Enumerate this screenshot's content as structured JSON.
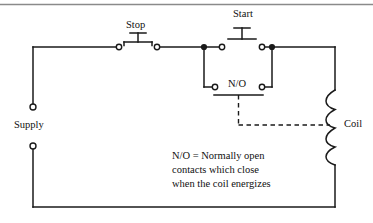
{
  "figure": {
    "type": "electrical-schematic",
    "width": 373,
    "height": 223,
    "background_color": "#ffffff",
    "line_color": "#1a1a1a"
  },
  "labels": {
    "stop": "Stop",
    "start": "Start",
    "no_contact": "N/O",
    "coil": "Coil",
    "supply": "Supply"
  },
  "caption": {
    "line1": "N/O = Normally open",
    "line2": "contacts which close",
    "line3": "when the coil energizes"
  },
  "components": {
    "stop_button": {
      "kind": "normally-closed-pushbutton",
      "terminal_left_x": 119,
      "terminal_right_x": 157,
      "y": 47
    },
    "start_button": {
      "kind": "normally-open-pushbutton",
      "terminal_left_x": 222,
      "terminal_right_x": 262,
      "y": 47
    },
    "holding_contact": {
      "kind": "normally-open-auxiliary-contact",
      "terminal_left_x": 215,
      "terminal_right_x": 262,
      "y": 87
    },
    "coil": {
      "kind": "relay-coil",
      "arcs": 4,
      "x": 335,
      "y_top": 90,
      "y_bottom": 165
    },
    "supply_terminals": {
      "kind": "open-terminal",
      "x": 33,
      "top_y": 108,
      "bottom_y": 145
    }
  }
}
